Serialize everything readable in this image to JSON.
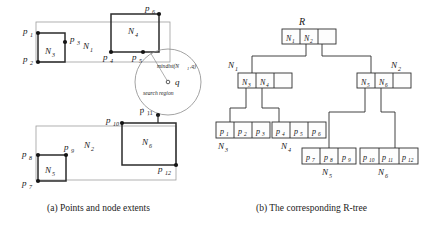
{
  "figure": {
    "captions": {
      "a": "(a) Points and node extents",
      "b": "(b) The corresponding R-tree"
    }
  },
  "panel_a": {
    "title": "Points and node extents",
    "node_labels": {
      "n1": "N",
      "n1_sub": "1",
      "n2": "N",
      "n2_sub": "2",
      "n3": "N",
      "n3_sub": "3",
      "n4": "N",
      "n4_sub": "4",
      "n5": "N",
      "n5_sub": "5",
      "n6": "N",
      "n6_sub": "6"
    },
    "point_labels": [
      {
        "name": "p",
        "sub": "1"
      },
      {
        "name": "p",
        "sub": "2"
      },
      {
        "name": "p",
        "sub": "3"
      },
      {
        "name": "p",
        "sub": "4"
      },
      {
        "name": "p",
        "sub": "5"
      },
      {
        "name": "p",
        "sub": "6"
      },
      {
        "name": "p",
        "sub": "7"
      },
      {
        "name": "p",
        "sub": "8"
      },
      {
        "name": "p",
        "sub": "9"
      },
      {
        "name": "p",
        "sub": "10"
      },
      {
        "name": "p",
        "sub": "11"
      },
      {
        "name": "p",
        "sub": "12"
      }
    ],
    "query": {
      "point_label": "q",
      "mindist_label_prefix": "mindist(N",
      "mindist_label_sub": "1",
      "mindist_label_suffix": ",q)",
      "search_region_label": "search region"
    }
  },
  "panel_b": {
    "title": "The corresponding R-tree",
    "root_label": "R",
    "root_cells": [
      {
        "name": "N",
        "sub": "1"
      },
      {
        "name": "N",
        "sub": "2"
      },
      {
        "name": "",
        "sub": ""
      }
    ],
    "level1": [
      {
        "label": {
          "name": "N",
          "sub": "1"
        },
        "cells": [
          {
            "name": "N",
            "sub": "3"
          },
          {
            "name": "N",
            "sub": "4"
          },
          {
            "name": "",
            "sub": ""
          }
        ]
      },
      {
        "label": {
          "name": "N",
          "sub": "2"
        },
        "cells": [
          {
            "name": "N",
            "sub": "5"
          },
          {
            "name": "N",
            "sub": "6"
          },
          {
            "name": "",
            "sub": ""
          }
        ]
      }
    ],
    "leaves": [
      {
        "label": {
          "name": "N",
          "sub": "3"
        },
        "cells": [
          {
            "name": "p",
            "sub": "1"
          },
          {
            "name": "p",
            "sub": "2"
          },
          {
            "name": "p",
            "sub": "3"
          }
        ]
      },
      {
        "label": {
          "name": "N",
          "sub": "4"
        },
        "cells": [
          {
            "name": "p",
            "sub": "4"
          },
          {
            "name": "p",
            "sub": "5"
          },
          {
            "name": "p",
            "sub": "6"
          }
        ]
      },
      {
        "label": {
          "name": "N",
          "sub": "5"
        },
        "cells": [
          {
            "name": "p",
            "sub": "7"
          },
          {
            "name": "p",
            "sub": "8"
          },
          {
            "name": "p",
            "sub": "9"
          }
        ]
      },
      {
        "label": {
          "name": "N",
          "sub": "6"
        },
        "cells": [
          {
            "name": "p",
            "sub": "10"
          },
          {
            "name": "p",
            "sub": "11"
          },
          {
            "name": "p",
            "sub": "12"
          }
        ]
      }
    ]
  },
  "colors": {
    "ink": "#1a1a1a",
    "thin_line": "#9a9a9a",
    "thick_line": "#2b2b2b",
    "paper": "#ffffff"
  }
}
